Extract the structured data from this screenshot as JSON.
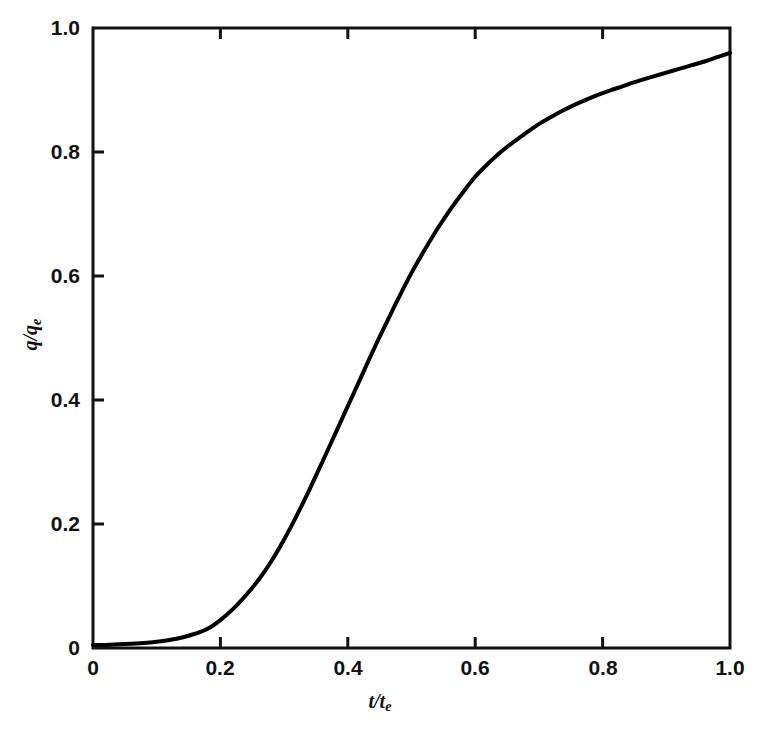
{
  "figure": {
    "background_color": "#ffffff",
    "line_color": "#000000",
    "axis_color": "#111111"
  },
  "axes": {
    "x_title_main": "t/t",
    "x_title_sub": "e",
    "y_title_main": "q/q",
    "y_title_sub": "e",
    "x_ticks": [
      "0",
      "0.2",
      "0.4",
      "0.6",
      "0.8",
      "1.0"
    ],
    "y_ticks": [
      "0",
      "0.2",
      "0.4",
      "0.6",
      "0.8",
      "1.0"
    ]
  },
  "chart_data": {
    "type": "line",
    "title": "",
    "subtitle": "",
    "xlabel": "t/te",
    "ylabel": "q/qe",
    "xlim": [
      0,
      1.0
    ],
    "ylim": [
      0,
      1.0
    ],
    "grid": false,
    "legend": false,
    "legend_position": "none",
    "xticks": [
      0,
      0.2,
      0.4,
      0.6,
      0.8,
      1.0
    ],
    "yticks": [
      0,
      0.2,
      0.4,
      0.6,
      0.8,
      1.0
    ],
    "xtick_labels": [
      "0",
      "0.2",
      "0.4",
      "0.6",
      "0.8",
      "1.0"
    ],
    "ytick_labels": [
      "0",
      "0.2",
      "0.4",
      "0.6",
      "0.8",
      "1.0"
    ],
    "series": [
      {
        "name": "q/qe vs t/te",
        "line_width": 4,
        "color": "#000000",
        "x": [
          0.0,
          0.02,
          0.04,
          0.06,
          0.08,
          0.1,
          0.12,
          0.14,
          0.16,
          0.18,
          0.2,
          0.22,
          0.24,
          0.26,
          0.28,
          0.3,
          0.32,
          0.34,
          0.36,
          0.38,
          0.4,
          0.42,
          0.44,
          0.46,
          0.48,
          0.5,
          0.52,
          0.54,
          0.56,
          0.58,
          0.6,
          0.62,
          0.64,
          0.66,
          0.68,
          0.7,
          0.72,
          0.74,
          0.76,
          0.78,
          0.8,
          0.82,
          0.84,
          0.86,
          0.88,
          0.9,
          0.92,
          0.94,
          0.96,
          0.98,
          1.0
        ],
        "y": [
          0.005,
          0.005,
          0.006,
          0.007,
          0.008,
          0.01,
          0.013,
          0.017,
          0.023,
          0.031,
          0.045,
          0.063,
          0.085,
          0.11,
          0.14,
          0.175,
          0.214,
          0.256,
          0.3,
          0.345,
          0.39,
          0.435,
          0.48,
          0.523,
          0.565,
          0.605,
          0.641,
          0.675,
          0.706,
          0.734,
          0.76,
          0.781,
          0.8,
          0.816,
          0.831,
          0.845,
          0.857,
          0.868,
          0.878,
          0.887,
          0.895,
          0.902,
          0.909,
          0.916,
          0.922,
          0.928,
          0.934,
          0.94,
          0.946,
          0.953,
          0.96
        ]
      }
    ],
    "annotations": []
  }
}
